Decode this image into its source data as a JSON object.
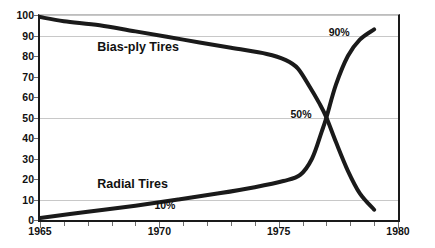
{
  "chart_data": {
    "type": "line",
    "title": "",
    "xlabel": "",
    "ylabel": "",
    "xlim": [
      1965,
      1980
    ],
    "ylim": [
      0,
      100
    ],
    "grid": "horizontal gridlines at 10, 50, 90, 100",
    "legend_position": "inline labels on plot",
    "x_tick_labels": [
      "1965",
      "1970",
      "1975",
      "1980"
    ],
    "x_tick_values": [
      1965,
      1970,
      1975,
      1980
    ],
    "x_minor_tick_values": [
      1966,
      1967,
      1968,
      1969,
      1971,
      1972,
      1973,
      1974,
      1976,
      1977,
      1978,
      1979
    ],
    "y_tick_labels": [
      "0",
      "10",
      "20",
      "30",
      "40",
      "50",
      "60",
      "70",
      "80",
      "90",
      "100"
    ],
    "y_tick_values": [
      0,
      10,
      20,
      30,
      40,
      50,
      60,
      70,
      80,
      90,
      100
    ],
    "gridline_values": [
      10,
      50,
      90,
      100
    ],
    "series": [
      {
        "name": "Bias-ply Tires",
        "color": "#1a1a1a",
        "x": [
          1965.0,
          1966.0,
          1967.5,
          1969.0,
          1971.0,
          1973.0,
          1974.5,
          1975.3,
          1975.8,
          1976.3,
          1976.7,
          1977.0,
          1977.4,
          1977.9,
          1978.4,
          1979.0
        ],
        "values": [
          99,
          97,
          95,
          92,
          88,
          84,
          81,
          78,
          74,
          65,
          57,
          50,
          38,
          24,
          13,
          5
        ]
      },
      {
        "name": "Radial Tires",
        "color": "#1a1a1a",
        "x": [
          1965.0,
          1967.0,
          1969.0,
          1970.8,
          1972.5,
          1974.0,
          1975.2,
          1975.9,
          1976.4,
          1976.8,
          1977.0,
          1977.4,
          1977.9,
          1978.4,
          1979.0
        ],
        "values": [
          1,
          4,
          7,
          10,
          13,
          16,
          19,
          22,
          30,
          43,
          50,
          66,
          80,
          88,
          93
        ]
      }
    ],
    "annotations": [
      {
        "text": "90%",
        "x": 1978.1,
        "y": 91
      },
      {
        "text": "50%",
        "x": 1976.5,
        "y": 51
      },
      {
        "text": "10%",
        "x": 1970.8,
        "y": 7
      }
    ],
    "series_labels": [
      {
        "text": "Bias-ply Tires",
        "x": 1967.4,
        "y": 84
      },
      {
        "text": "Radial Tires",
        "x": 1967.4,
        "y": 17
      }
    ]
  }
}
